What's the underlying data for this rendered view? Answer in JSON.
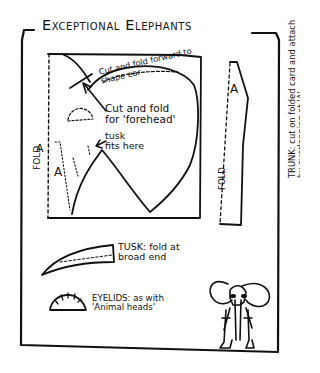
{
  "title": "Exceptional Elephants",
  "ear_template": {
    "note_fold_forward": "Cut and fold forward to shape ear",
    "note_forehead": [
      "Cut and fold",
      "for 'forehead'"
    ],
    "note_tusk": [
      "tusk",
      "fits here"
    ],
    "fold_label": "FOLD",
    "marker_a_top": "A",
    "marker_a_inner": "A"
  },
  "trunk_template": {
    "fold_label": "FOLD",
    "marker_a": "A",
    "note": [
      "TRUNK: cut on folded card and attach",
      "by overlapping at 'A'"
    ]
  },
  "tusk_template": {
    "note": [
      "TUSK: fold at",
      "broad end"
    ]
  },
  "eyelid_template": {
    "note": [
      "EYELIDS: as with",
      "'Animal heads'"
    ]
  },
  "illustration": {
    "subject": "elephant-figure"
  }
}
